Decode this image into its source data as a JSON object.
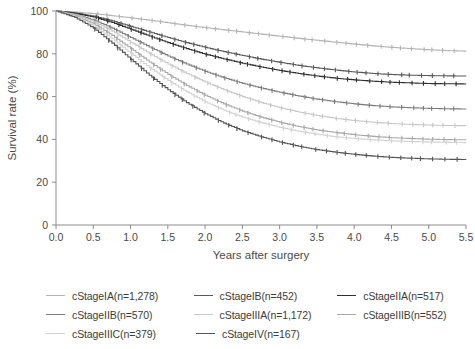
{
  "chart_data": {
    "type": "line",
    "title": "",
    "xlabel": "Years after surgery",
    "ylabel": "Survival rate (%)",
    "xlim": [
      0.0,
      5.5
    ],
    "ylim": [
      0,
      100
    ],
    "xticks": [
      "0.0",
      "0.5",
      "1.0",
      "1.5",
      "2.0",
      "2.5",
      "3.0",
      "3.5",
      "4.0",
      "4.5",
      "5.0",
      "5.5"
    ],
    "yticks": [
      "0",
      "20",
      "40",
      "60",
      "80",
      "100"
    ],
    "grid": false,
    "legend_position": "bottom",
    "censor_marks": true,
    "x": [
      0.0,
      0.25,
      0.5,
      0.75,
      1.0,
      1.25,
      1.5,
      1.75,
      2.0,
      2.25,
      2.5,
      2.75,
      3.0,
      3.25,
      3.5,
      3.75,
      4.0,
      4.25,
      4.5,
      4.75,
      5.0,
      5.25,
      5.5
    ],
    "series": [
      {
        "name": "cStageIA",
        "n": 1278,
        "label": "cStageIA(n=1,278)",
        "color": "#b4b4b4",
        "values": [
          100,
          99.5,
          98.8,
          97.8,
          96.8,
          95.7,
          94.5,
          93.3,
          92.2,
          91.2,
          90.2,
          89.2,
          88.2,
          87.2,
          86.3,
          85.4,
          84.5,
          83.7,
          83.0,
          82.4,
          81.9,
          81.5,
          81.2
        ]
      },
      {
        "name": "cStageIB",
        "n": 452,
        "label": "cStageIB(n=452)",
        "color": "#5a5a5a",
        "values": [
          100,
          99.1,
          97.6,
          95.4,
          92.8,
          90.2,
          87.6,
          85.2,
          83.0,
          81.0,
          79.2,
          77.5,
          76.0,
          74.6,
          73.4,
          72.4,
          71.5,
          70.8,
          70.3,
          70.0,
          69.8,
          69.7,
          69.6
        ]
      },
      {
        "name": "cStageIIA",
        "n": 517,
        "label": "cStageIIA(n=517)",
        "color": "#303030",
        "values": [
          100,
          98.9,
          97.2,
          94.6,
          91.5,
          88.3,
          85.2,
          82.4,
          79.8,
          77.6,
          75.6,
          73.8,
          72.2,
          70.8,
          69.6,
          68.6,
          67.8,
          67.2,
          66.7,
          66.4,
          66.1,
          66.0,
          65.9
        ]
      },
      {
        "name": "cStageIIB",
        "n": 570,
        "label": "cStageIIB(n=570)",
        "color": "#7d7d7d",
        "values": [
          100,
          98.4,
          95.8,
          92.0,
          87.6,
          83.2,
          79.0,
          75.2,
          71.8,
          68.8,
          66.2,
          64.0,
          62.0,
          60.3,
          58.8,
          57.6,
          56.6,
          55.8,
          55.2,
          54.8,
          54.5,
          54.3,
          54.2
        ]
      },
      {
        "name": "cStageIIIA",
        "n": 1172,
        "label": "cStageIIIA(n=1,172)",
        "color": "#c8c8c8",
        "values": [
          100,
          98.2,
          95.0,
          90.6,
          85.4,
          80.2,
          75.2,
          70.8,
          66.8,
          63.2,
          60.0,
          57.2,
          54.8,
          52.8,
          51.2,
          49.8,
          48.8,
          48.0,
          47.4,
          47.0,
          46.7,
          46.5,
          46.4
        ]
      },
      {
        "name": "cStageIIIB",
        "n": 552,
        "label": "cStageIIIB(n=552)",
        "color": "#a8a8a8",
        "values": [
          100,
          97.8,
          94.0,
          88.6,
          82.4,
          76.2,
          70.4,
          65.2,
          60.6,
          56.6,
          53.2,
          50.4,
          48.0,
          46.0,
          44.4,
          43.2,
          42.2,
          41.4,
          40.8,
          40.4,
          40.1,
          39.9,
          39.8
        ]
      },
      {
        "name": "cStageIIIC",
        "n": 379,
        "label": "cStageIIIC(n=379)",
        "color": "#d2d2d2",
        "values": [
          100,
          97.4,
          93.0,
          87.0,
          80.2,
          73.6,
          67.6,
          62.2,
          57.6,
          53.6,
          50.4,
          47.8,
          45.6,
          43.8,
          42.4,
          41.2,
          40.4,
          39.8,
          39.3,
          39.0,
          38.8,
          38.6,
          38.5
        ]
      },
      {
        "name": "cStageIV",
        "n": 167,
        "label": "cStageIV(n=167)",
        "color": "#555555",
        "values": [
          100,
          97.0,
          92.0,
          85.0,
          77.4,
          70.0,
          63.2,
          57.2,
          52.0,
          47.6,
          44.0,
          41.2,
          38.8,
          36.8,
          35.2,
          34.0,
          33.0,
          32.2,
          31.6,
          31.2,
          30.9,
          30.7,
          30.6
        ]
      }
    ]
  },
  "legend": {
    "rows": [
      [
        {
          "label": "cStageIA(n=1,278)",
          "color": "#b4b4b4",
          "name": "legend-item-cstage-ia"
        },
        {
          "label": "cStageIB(n=452)",
          "color": "#5a5a5a",
          "name": "legend-item-cstage-ib"
        },
        {
          "label": "cStageIIA(n=517)",
          "color": "#303030",
          "name": "legend-item-cstage-iia"
        }
      ],
      [
        {
          "label": "cStageIIB(n=570)",
          "color": "#7d7d7d",
          "name": "legend-item-cstage-iib"
        },
        {
          "label": "cStageIIIA(n=1,172)",
          "color": "#c8c8c8",
          "name": "legend-item-cstage-iiia"
        },
        {
          "label": "cStageIIIB(n=552)",
          "color": "#a8a8a8",
          "name": "legend-item-cstage-iiib"
        }
      ],
      [
        {
          "label": "cStageIIIC(n=379)",
          "color": "#d2d2d2",
          "name": "legend-item-cstage-iiic"
        },
        {
          "label": "cStageIV(n=167)",
          "color": "#555555",
          "name": "legend-item-cstage-iv"
        }
      ]
    ]
  },
  "axes": {
    "x_title": "Years after surgery",
    "y_title": "Survival rate (%)"
  }
}
